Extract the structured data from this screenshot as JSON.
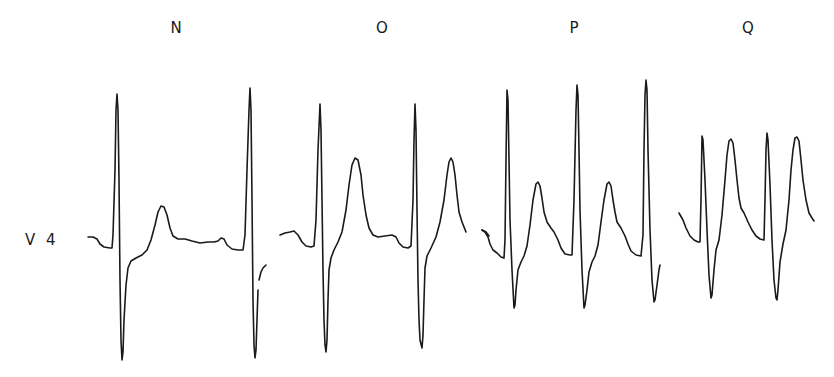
{
  "figure": {
    "lead_label": "V 4",
    "trace_color": "#1a1a1a",
    "background_color": "#ffffff"
  },
  "panels": [
    {
      "id": "N",
      "label": "N",
      "description": "Normal V4 complex: two beats, upright T wave of modest amplitude",
      "beats": 2
    },
    {
      "id": "O",
      "label": "O",
      "description": "Taller, peaked T waves",
      "beats": 2
    },
    {
      "id": "P",
      "label": "P",
      "description": "Faster rate, three beats, prominent T waves",
      "beats": 3
    },
    {
      "id": "Q",
      "label": "Q",
      "description": "Tall peaked T waves approaching R-wave amplitude",
      "beats": 2
    }
  ]
}
